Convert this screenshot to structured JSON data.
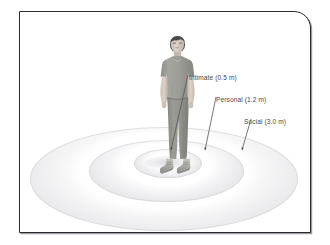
{
  "figure": {
    "frame_border_color": "#2b2b30",
    "background_color": "#ffffff"
  },
  "zones": [
    {
      "id": "intimate",
      "label": "Intimate (0.5 m)",
      "name": "Intimate",
      "distance": "0.5 m",
      "ring_index": 1
    },
    {
      "id": "personal",
      "label": "Personal (1.2 m)",
      "name": "Personal",
      "distance": "1.2 m",
      "ring_index": 2
    },
    {
      "id": "social",
      "label": "Social (3.0 m)",
      "name": "Social",
      "distance": "3.0 m",
      "ring_index": 3
    }
  ],
  "person": {
    "description": "Young man standing facing forward, arms at sides",
    "hair_color": "#4a4a4d",
    "skin_color": "#d8cdc2",
    "shirt_color": "#9b9b96",
    "pants_color": "#93938e",
    "shoe_color": "#b5b5b0"
  },
  "colors": {
    "ring_shade": "#e6e6e9",
    "label_text": "#4a4a50",
    "arrow": "#4a4a50"
  }
}
